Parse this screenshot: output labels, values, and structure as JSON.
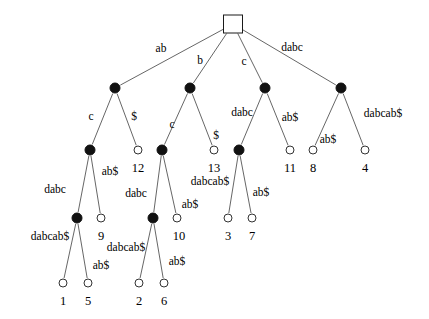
{
  "figure": {
    "width": 429,
    "height": 319,
    "background": "#ffffff",
    "ink_color": "#000000",
    "internal_node_color": "#111111",
    "leaf_node_color": "#ffffff"
  },
  "nodes": [
    {
      "id": "root",
      "kind": "root",
      "x": 233,
      "y": 24
    },
    {
      "id": "i1",
      "kind": "internal",
      "x": 115,
      "y": 88
    },
    {
      "id": "i2",
      "kind": "internal",
      "x": 190,
      "y": 88
    },
    {
      "id": "i3",
      "kind": "internal",
      "x": 265,
      "y": 88
    },
    {
      "id": "i4",
      "kind": "internal",
      "x": 341,
      "y": 88
    },
    {
      "id": "i5",
      "kind": "internal",
      "x": 90,
      "y": 150
    },
    {
      "id": "l12",
      "kind": "leaf",
      "x": 138,
      "y": 150
    },
    {
      "id": "i6",
      "kind": "internal",
      "x": 162,
      "y": 150
    },
    {
      "id": "l13",
      "kind": "leaf",
      "x": 214,
      "y": 150
    },
    {
      "id": "i7",
      "kind": "internal",
      "x": 239,
      "y": 150
    },
    {
      "id": "l11",
      "kind": "leaf",
      "x": 290,
      "y": 150
    },
    {
      "id": "l8",
      "kind": "leaf",
      "x": 313,
      "y": 150
    },
    {
      "id": "l4",
      "kind": "leaf",
      "x": 365,
      "y": 150
    },
    {
      "id": "i8",
      "kind": "internal",
      "x": 77,
      "y": 218
    },
    {
      "id": "l9",
      "kind": "leaf",
      "x": 101,
      "y": 218
    },
    {
      "id": "i9",
      "kind": "internal",
      "x": 153,
      "y": 218
    },
    {
      "id": "l10",
      "kind": "leaf",
      "x": 177,
      "y": 218
    },
    {
      "id": "l3",
      "kind": "leaf",
      "x": 228,
      "y": 218
    },
    {
      "id": "l7",
      "kind": "leaf",
      "x": 252,
      "y": 218
    },
    {
      "id": "l1",
      "kind": "leaf",
      "x": 63,
      "y": 283
    },
    {
      "id": "l5",
      "kind": "leaf",
      "x": 88,
      "y": 283
    },
    {
      "id": "l2",
      "kind": "leaf",
      "x": 139,
      "y": 283
    },
    {
      "id": "l6",
      "kind": "leaf",
      "x": 164,
      "y": 283
    }
  ],
  "edges": [
    {
      "from": "root",
      "to": "i1"
    },
    {
      "from": "root",
      "to": "i2"
    },
    {
      "from": "root",
      "to": "i3"
    },
    {
      "from": "root",
      "to": "i4"
    },
    {
      "from": "i1",
      "to": "i5"
    },
    {
      "from": "i1",
      "to": "l12"
    },
    {
      "from": "i2",
      "to": "i6"
    },
    {
      "from": "i2",
      "to": "l13"
    },
    {
      "from": "i3",
      "to": "i7"
    },
    {
      "from": "i3",
      "to": "l11"
    },
    {
      "from": "i4",
      "to": "l8"
    },
    {
      "from": "i4",
      "to": "l4"
    },
    {
      "from": "i5",
      "to": "i8"
    },
    {
      "from": "i5",
      "to": "l9"
    },
    {
      "from": "i6",
      "to": "i9"
    },
    {
      "from": "i6",
      "to": "l10"
    },
    {
      "from": "i7",
      "to": "l3"
    },
    {
      "from": "i7",
      "to": "l7"
    },
    {
      "from": "i8",
      "to": "l1"
    },
    {
      "from": "i8",
      "to": "l5"
    },
    {
      "from": "i9",
      "to": "l2"
    },
    {
      "from": "i9",
      "to": "l6"
    }
  ],
  "edge_labels": [
    {
      "id": "el-root-i1",
      "text": "ab",
      "x": 161,
      "y": 49
    },
    {
      "id": "el-root-i2",
      "text": "b",
      "x": 200,
      "y": 61
    },
    {
      "id": "el-root-i3",
      "text": "c",
      "x": 244,
      "y": 62
    },
    {
      "id": "el-root-i4",
      "text": "dabc",
      "x": 292,
      "y": 48
    },
    {
      "id": "el-i1-i5",
      "text": "c",
      "x": 91,
      "y": 117
    },
    {
      "id": "el-i1-l12",
      "text": "$",
      "x": 134,
      "y": 117
    },
    {
      "id": "el-i2-i6",
      "text": "c",
      "x": 172,
      "y": 125
    },
    {
      "id": "el-i2-l13",
      "text": "$",
      "x": 216,
      "y": 136
    },
    {
      "id": "el-i3-i7",
      "text": "dabc",
      "x": 242,
      "y": 113
    },
    {
      "id": "el-i3-l11",
      "text": "ab$",
      "x": 290,
      "y": 118
    },
    {
      "id": "el-i4-l8",
      "text": "ab$",
      "x": 328,
      "y": 140
    },
    {
      "id": "el-i4-l4",
      "text": "dabcab$",
      "x": 383,
      "y": 114
    },
    {
      "id": "el-i5-i8",
      "text": "dabc",
      "x": 55,
      "y": 190
    },
    {
      "id": "el-i5-l9",
      "text": "ab$",
      "x": 110,
      "y": 172
    },
    {
      "id": "el-i6-i9",
      "text": "dabc",
      "x": 136,
      "y": 194
    },
    {
      "id": "el-i6-l10",
      "text": "ab$",
      "x": 190,
      "y": 205
    },
    {
      "id": "el-i7-l3",
      "text": "dabcab$",
      "x": 210,
      "y": 182
    },
    {
      "id": "el-i7-l7",
      "text": "ab$",
      "x": 261,
      "y": 193
    },
    {
      "id": "el-i8-l1",
      "text": "dabcab$",
      "x": 50,
      "y": 237
    },
    {
      "id": "el-i8-l5",
      "text": "ab$",
      "x": 101,
      "y": 266
    },
    {
      "id": "el-i9-l2",
      "text": "dabcab$",
      "x": 126,
      "y": 248
    },
    {
      "id": "el-i9-l6",
      "text": "ab$",
      "x": 177,
      "y": 262
    }
  ],
  "leaf_labels": [
    {
      "id": "ll-12",
      "text": "12",
      "x": 138,
      "y": 168
    },
    {
      "id": "ll-13",
      "text": "13",
      "x": 214,
      "y": 168
    },
    {
      "id": "ll-11",
      "text": "11",
      "x": 290,
      "y": 168
    },
    {
      "id": "ll-8",
      "text": "8",
      "x": 313,
      "y": 168
    },
    {
      "id": "ll-4",
      "text": "4",
      "x": 365,
      "y": 168
    },
    {
      "id": "ll-9",
      "text": "9",
      "x": 101,
      "y": 236
    },
    {
      "id": "ll-10",
      "text": "10",
      "x": 179,
      "y": 236
    },
    {
      "id": "ll-3",
      "text": "3",
      "x": 228,
      "y": 236
    },
    {
      "id": "ll-7",
      "text": "7",
      "x": 252,
      "y": 236
    },
    {
      "id": "ll-1",
      "text": "1",
      "x": 63,
      "y": 301
    },
    {
      "id": "ll-5",
      "text": "5",
      "x": 88,
      "y": 301
    },
    {
      "id": "ll-2",
      "text": "2",
      "x": 139,
      "y": 301
    },
    {
      "id": "ll-6",
      "text": "6",
      "x": 164,
      "y": 301
    }
  ]
}
